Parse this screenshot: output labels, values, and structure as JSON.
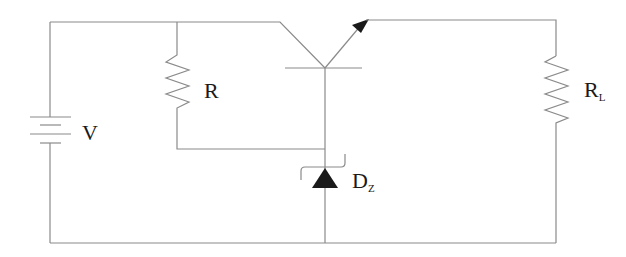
{
  "diagram": {
    "type": "circuit-schematic",
    "components": {
      "source": {
        "label": "V",
        "kind": "battery"
      },
      "bias_resistor": {
        "label": "R",
        "kind": "resistor"
      },
      "transistor": {
        "kind": "npn-bjt",
        "terminals": [
          "collector",
          "base",
          "emitter"
        ]
      },
      "zener": {
        "label_main": "D",
        "label_sub": "Z",
        "kind": "zener-diode"
      },
      "load": {
        "label_main": "R",
        "label_sub": "L",
        "kind": "resistor"
      }
    },
    "colors": {
      "wire": "#8a8a8a",
      "symbol_fill": "#1a1a1a",
      "background": "#ffffff"
    }
  }
}
